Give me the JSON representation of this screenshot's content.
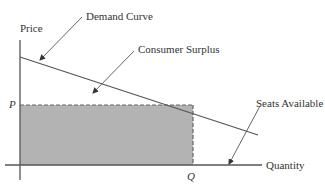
{
  "diagram": {
    "type": "economics-demand-diagram",
    "axes": {
      "y_label": "Price",
      "x_label": "Quantity"
    },
    "markers": {
      "price_level": "P",
      "quantity_level": "Q"
    },
    "annotations": {
      "demand_curve": "Demand Curve",
      "consumer_surplus": "Consumer Surplus",
      "seats_available": "Seats Available"
    },
    "colors": {
      "line": "#555555",
      "shaded_area": "#b3b3b3",
      "text": "#333333",
      "background": "#ffffff"
    }
  }
}
